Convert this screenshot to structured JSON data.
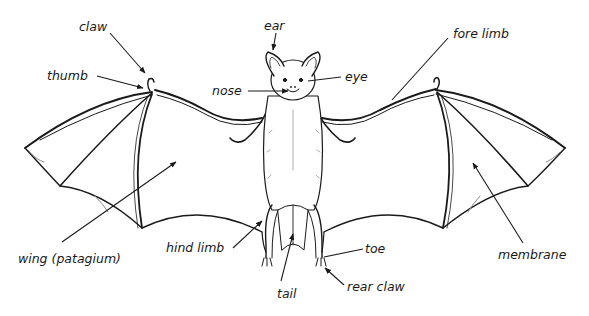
{
  "diagram": {
    "labels": {
      "claw": "claw",
      "thumb": "thumb",
      "ear": "ear",
      "nose": "nose",
      "eye": "eye",
      "fore_limb": "fore limb",
      "wing": "wing (patagium)",
      "hind_limb": "hind limb",
      "tail": "tail",
      "toe": "toe",
      "rear_claw": "rear claw",
      "membrane": "membrane"
    },
    "colors": {
      "ink": "#1a1a1a",
      "background": "#ffffff",
      "shade": "#8a8a8a"
    }
  }
}
